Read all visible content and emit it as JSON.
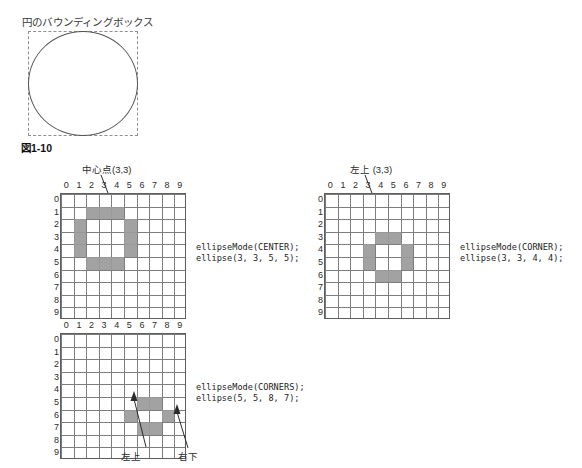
{
  "figure": {
    "bbox_title": "円のバウンディングボックス",
    "caption": "図1-10"
  },
  "grid": {
    "columns": [
      "0",
      "1",
      "2",
      "3",
      "4",
      "5",
      "6",
      "7",
      "8",
      "9"
    ],
    "rows": [
      "0",
      "1",
      "2",
      "3",
      "4",
      "5",
      "6",
      "7",
      "8",
      "9"
    ],
    "cell_size_px": 12.6,
    "line_color": "#7d7d7d",
    "fill_color": "#9a9a9a"
  },
  "diagrams": [
    {
      "id": "center-mode",
      "label": "中心点(3,3)",
      "code_line1": "ellipseMode(CENTER);",
      "code_line2": "ellipse(3, 3, 5, 5);",
      "cells": [
        [
          2,
          1
        ],
        [
          3,
          1
        ],
        [
          4,
          1
        ],
        [
          1,
          2
        ],
        [
          5,
          2
        ],
        [
          1,
          3
        ],
        [
          5,
          3
        ],
        [
          1,
          4
        ],
        [
          5,
          4
        ],
        [
          2,
          5
        ],
        [
          3,
          5
        ],
        [
          4,
          5
        ]
      ]
    },
    {
      "id": "corner-mode",
      "label": "左上 (3,3)",
      "code_line1": "ellipseMode(CORNER);",
      "code_line2": "ellipse(3, 3, 4, 4);",
      "cells": [
        [
          4,
          3
        ],
        [
          5,
          3
        ],
        [
          3,
          4
        ],
        [
          6,
          4
        ],
        [
          3,
          5
        ],
        [
          6,
          5
        ],
        [
          4,
          6
        ],
        [
          5,
          6
        ]
      ]
    },
    {
      "id": "corners-mode",
      "label_topleft": "左上",
      "label_bottomright": "右下",
      "code_line1": "ellipseMode(CORNERS);",
      "code_line2": "ellipse(5, 5, 8, 7);",
      "cells": [
        [
          6,
          5
        ],
        [
          7,
          5
        ],
        [
          5,
          6
        ],
        [
          8,
          6
        ],
        [
          6,
          7
        ],
        [
          7,
          7
        ]
      ]
    }
  ]
}
